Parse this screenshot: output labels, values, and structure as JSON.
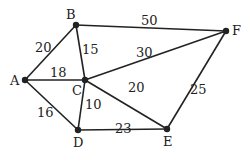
{
  "graph": {
    "type": "weighted-undirected",
    "nodes": [
      {
        "id": "A",
        "label": "A",
        "x": 25,
        "y": 80
      },
      {
        "id": "B",
        "label": "B",
        "x": 76,
        "y": 25
      },
      {
        "id": "C",
        "label": "C",
        "x": 85,
        "y": 80
      },
      {
        "id": "D",
        "label": "D",
        "x": 78,
        "y": 130
      },
      {
        "id": "E",
        "label": "E",
        "x": 167,
        "y": 129
      },
      {
        "id": "F",
        "label": "F",
        "x": 226,
        "y": 31
      }
    ],
    "edges": [
      {
        "from": "A",
        "to": "B",
        "weight": "20"
      },
      {
        "from": "A",
        "to": "C",
        "weight": "18"
      },
      {
        "from": "A",
        "to": "D",
        "weight": "16"
      },
      {
        "from": "B",
        "to": "C",
        "weight": "15"
      },
      {
        "from": "B",
        "to": "F",
        "weight": "50"
      },
      {
        "from": "C",
        "to": "F",
        "weight": "30"
      },
      {
        "from": "C",
        "to": "E",
        "weight": "20"
      },
      {
        "from": "C",
        "to": "D",
        "weight": "10"
      },
      {
        "from": "D",
        "to": "E",
        "weight": "23"
      },
      {
        "from": "E",
        "to": "F",
        "weight": "25"
      }
    ]
  }
}
